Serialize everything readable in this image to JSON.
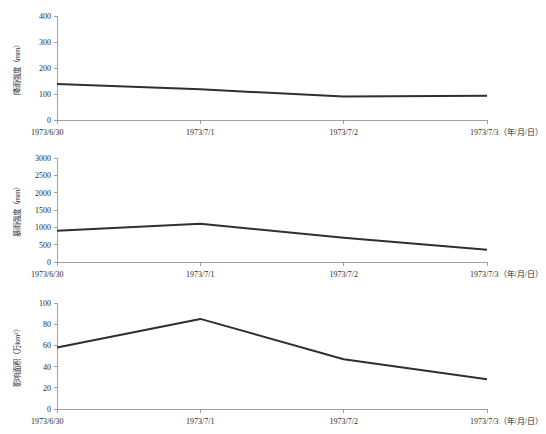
{
  "figure": {
    "background_color": "#ffffff",
    "line_color": "#2f2f2f",
    "axis_color": "#8a8a8a"
  },
  "chart_data": [
    {
      "type": "line",
      "title": "",
      "ylabel": "降雨强度（mm）",
      "xlabel": "1973/7/3（年/月/日）",
      "categories": [
        "1973/6/30",
        "1973/7/1",
        "1973/7/2",
        "1973/7/3"
      ],
      "values": [
        138,
        118,
        90,
        93
      ],
      "ylim": [
        0,
        400
      ],
      "yticks": [
        0,
        100,
        200,
        300,
        400
      ],
      "ytick_labels": [
        "0",
        "100",
        "200",
        "300",
        "400"
      ],
      "xtick_labels": [
        "1973/6/30",
        "1973/7/1",
        "1973/7/2",
        "1973/7/3（年/月/日）"
      ],
      "grid": false,
      "legend": "none"
    },
    {
      "type": "line",
      "title": "",
      "ylabel": "暴雨强度（mm）",
      "xlabel": "1973/7/3（年/月/日）",
      "categories": [
        "1973/6/30",
        "1973/7/1",
        "1973/7/2",
        "1973/7/3"
      ],
      "values": [
        900,
        1100,
        700,
        350
      ],
      "ylim": [
        0,
        3000
      ],
      "yticks": [
        0,
        500,
        1000,
        1500,
        2000,
        2500,
        3000
      ],
      "ytick_labels": [
        "0",
        "500",
        "1000",
        "1500",
        "2000",
        "2500",
        "3000"
      ],
      "xtick_labels": [
        "1973/6/30",
        "1973/7/1",
        "1973/7/2",
        "1973/7/3（年/月/日）"
      ],
      "grid": false,
      "legend": "none"
    },
    {
      "type": "line",
      "title": "",
      "ylabel": "影响面积（万km²）",
      "xlabel": "1973/7/3（年/月/日）",
      "categories": [
        "1973/6/30",
        "1973/7/1",
        "1973/7/2",
        "1973/7/3"
      ],
      "values": [
        58,
        85,
        47,
        28
      ],
      "ylim": [
        0,
        100
      ],
      "yticks": [
        0,
        20,
        40,
        60,
        80,
        100
      ],
      "ytick_labels": [
        "0",
        "20",
        "40",
        "60",
        "80",
        "100"
      ],
      "xtick_labels": [
        "1973/6/30",
        "1973/7/1",
        "1973/7/2",
        "1973/7/3（年/月/日）"
      ],
      "grid": false,
      "legend": "none"
    }
  ]
}
